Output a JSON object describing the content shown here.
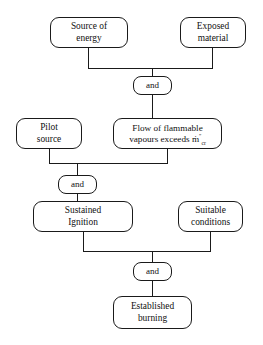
{
  "diagram": {
    "background_color": "#ffffff",
    "line_color": "#1a1a1a",
    "nodes": {
      "source_of_energy": "Source of\nenergy",
      "exposed_material": "Exposed\nmaterial",
      "gate_and_1": "and",
      "pilot_source": "Pilot\nsource",
      "flow_line1": "Flow of flammable",
      "flow_line2_prefix": "vapours exceeds ",
      "flow_symbol_base": "m",
      "flow_symbol_dot": "̇",
      "flow_symbol_superscript": "″",
      "flow_symbol_subscript": "cr",
      "gate_and_2": "and",
      "sustained_ignition": "Sustained\nIgnition",
      "suitable_conditions": "Suitable\nconditions",
      "gate_and_3": "and",
      "established_burning": "Established\nburning"
    }
  }
}
